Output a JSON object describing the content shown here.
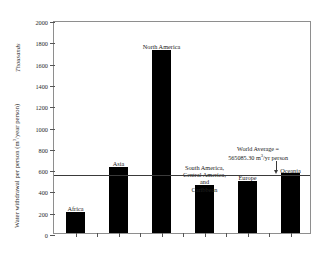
{
  "chart_data": {
    "type": "bar",
    "title": "",
    "xlabel": "",
    "ylabel": "Water withdrawal per person (m/year person)",
    "ylabel_unit_exponent": "3",
    "secondary_axis_note": "Thousands",
    "categories": [
      "Africa",
      "Asia",
      "North America",
      "South America, Central America, and Caribbean",
      "Europe",
      "Oceania"
    ],
    "values": [
      200,
      620,
      1720,
      450,
      490,
      560
    ],
    "ylim": [
      0,
      2000
    ],
    "yticks": [
      0,
      200,
      400,
      600,
      800,
      1000,
      1200,
      1400,
      1600,
      1800,
      2000
    ],
    "grid": false,
    "legend": null,
    "bar_color": "#000000",
    "annotations": [
      {
        "name": "world-average",
        "line_value": 565,
        "text_line1": "World Average =",
        "text_line2": "565085.30 m/yr person",
        "text_unit_exponent": "3"
      }
    ]
  },
  "axis": {
    "y_title_main": "Water withdrawal per person (m",
    "y_title_tail": "/year person)",
    "thousands": "Thousands",
    "tick_labels": [
      "2000",
      "1800",
      "1600",
      "1400",
      "1200",
      "1000",
      "800",
      "600",
      "400",
      "200",
      "0"
    ]
  },
  "bars": [
    {
      "label": "Africa",
      "label_lines": [
        "Africa"
      ],
      "value": 200
    },
    {
      "label": "Asia",
      "label_lines": [
        "Asia"
      ],
      "value": 620
    },
    {
      "label": "North America",
      "label_lines": [
        "North America"
      ],
      "value": 1720
    },
    {
      "label": "South America, Central America, and Caribbean",
      "label_lines": [
        "South America,",
        "Central America, and",
        "Caribbean"
      ],
      "value": 450
    },
    {
      "label": "Europe",
      "label_lines": [
        "Europe"
      ],
      "value": 490
    },
    {
      "label": "Oceania",
      "label_lines": [
        "Oceania"
      ],
      "value": 560
    }
  ],
  "world_average": {
    "line1": "World Average =",
    "line2_prefix": "565085.30 m",
    "line2_exp": "3",
    "line2_suffix": "/yr person",
    "value": 565
  }
}
